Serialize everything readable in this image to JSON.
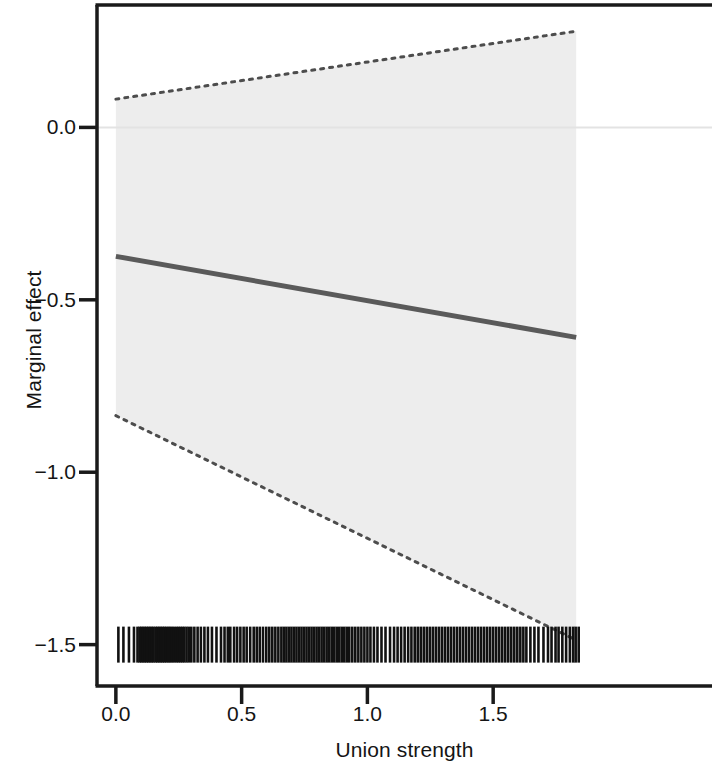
{
  "chart_data": {
    "type": "line",
    "title": "",
    "xlabel": "Union strength",
    "ylabel": "Marginal effect",
    "xlim": [
      -0.075,
      2.37
    ],
    "ylim": [
      -1.62,
      0.355
    ],
    "xticks": [
      0.0,
      0.5,
      1.0,
      1.5
    ],
    "xticklabels": [
      "0.0",
      "0.5",
      "1.0",
      "1.5"
    ],
    "yticks": [
      0.0,
      -0.5,
      -1.0,
      -1.5
    ],
    "yticklabels": [
      "0.0",
      "-0.5",
      "-1.0",
      "-1.5"
    ],
    "grid": false,
    "legend": "none",
    "zero_reference_line": {
      "y": 0.0,
      "color": "#e3e3e3",
      "style": "solid"
    },
    "series": [
      {
        "name": "Marginal effect",
        "style": "solid",
        "color": "#5a5a5a",
        "linewidth": 5,
        "x": [
          0.0,
          1.83
        ],
        "values": [
          -0.374,
          -0.609
        ]
      },
      {
        "name": "Upper 95% confidence bound",
        "style": "dotted",
        "color": "#4d4d4d",
        "linewidth": 3,
        "x": [
          0.0,
          1.83
        ],
        "values": [
          0.082,
          0.279
        ]
      },
      {
        "name": "Lower 95% confidence bound",
        "style": "dotted",
        "color": "#4d4d4d",
        "linewidth": 3,
        "x": [
          0.0,
          1.83
        ],
        "values": [
          -0.836,
          -1.487
        ]
      }
    ],
    "confidence_band": {
      "name": "95% confidence interval",
      "fill": "#ededed",
      "x": [
        0.0,
        1.83
      ],
      "lower": [
        -0.836,
        -1.487
      ],
      "upper": [
        0.082,
        0.279
      ]
    },
    "rug": {
      "name": "Union strength observations",
      "axis": "x",
      "y": -1.5,
      "color": "#111111",
      "values": [
        0.01,
        0.03,
        0.052,
        0.072,
        0.086,
        0.094,
        0.101,
        0.108,
        0.115,
        0.122,
        0.129,
        0.136,
        0.143,
        0.15,
        0.158,
        0.165,
        0.172,
        0.179,
        0.186,
        0.193,
        0.2,
        0.208,
        0.215,
        0.223,
        0.231,
        0.24,
        0.248,
        0.256,
        0.264,
        0.272,
        0.281,
        0.29,
        0.3,
        0.312,
        0.325,
        0.338,
        0.352,
        0.366,
        0.382,
        0.4,
        0.418,
        0.432,
        0.445,
        0.455,
        0.47,
        0.482,
        0.495,
        0.508,
        0.52,
        0.534,
        0.548,
        0.56,
        0.572,
        0.585,
        0.598,
        0.61,
        0.622,
        0.634,
        0.646,
        0.658,
        0.668,
        0.678,
        0.688,
        0.698,
        0.708,
        0.718,
        0.728,
        0.738,
        0.748,
        0.758,
        0.768,
        0.778,
        0.788,
        0.798,
        0.808,
        0.818,
        0.828,
        0.838,
        0.848,
        0.858,
        0.868,
        0.878,
        0.888,
        0.898,
        0.908,
        0.918,
        0.928,
        0.94,
        0.952,
        0.964,
        0.976,
        0.988,
        1.0,
        1.012,
        1.026,
        1.04,
        1.056,
        1.072,
        1.09,
        1.106,
        1.12,
        1.134,
        1.148,
        1.162,
        1.175,
        1.188,
        1.2,
        1.212,
        1.224,
        1.236,
        1.248,
        1.26,
        1.272,
        1.284,
        1.296,
        1.308,
        1.32,
        1.332,
        1.344,
        1.356,
        1.368,
        1.38,
        1.392,
        1.404,
        1.416,
        1.428,
        1.44,
        1.452,
        1.464,
        1.476,
        1.488,
        1.5,
        1.512,
        1.524,
        1.536,
        1.548,
        1.56,
        1.572,
        1.584,
        1.596,
        1.608,
        1.62,
        1.632,
        1.648,
        1.664,
        1.68,
        1.7,
        1.718,
        1.732,
        1.748,
        1.76,
        1.775,
        1.79,
        1.805,
        1.818,
        1.828,
        1.84
      ]
    }
  },
  "axes": {
    "frame_color": "#1a1a1a",
    "tick_color": "#1a1a1a"
  }
}
